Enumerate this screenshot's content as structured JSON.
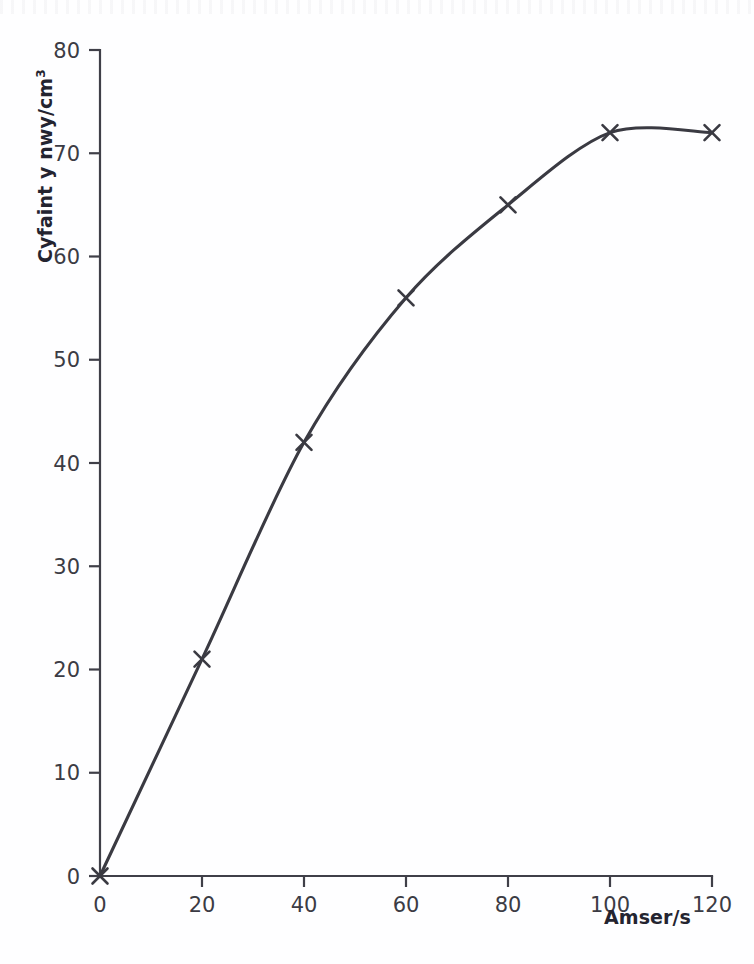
{
  "figure": {
    "background_color": "#fefeff",
    "ink_color": "#3a3a42",
    "text_color": "#2b2b33"
  },
  "axes": {
    "y_title_main": "Cyfaint y nwy/cm",
    "y_title_superscript": "3",
    "x_title": "Amser/s"
  },
  "chart_data": {
    "type": "line",
    "title": "",
    "xlabel": "Amser/s",
    "ylabel": "Cyfaint y nwy/cm3",
    "xlim": [
      0,
      120
    ],
    "ylim": [
      0,
      80
    ],
    "xticks": [
      0,
      20,
      40,
      60,
      80,
      100,
      120
    ],
    "yticks": [
      0,
      10,
      20,
      30,
      40,
      50,
      60,
      70,
      80
    ],
    "xtick_labels": [
      "0",
      "20",
      "40",
      "60",
      "80",
      "100",
      "120"
    ],
    "ytick_labels": [
      "0",
      "10",
      "20",
      "30",
      "40",
      "50",
      "60",
      "70",
      "80"
    ],
    "grid": false,
    "legend": null,
    "marker": "x",
    "line_color": "#3a3a42",
    "line_width": 3,
    "x": [
      0,
      20,
      40,
      60,
      80,
      100,
      120
    ],
    "values": [
      0,
      21,
      42,
      56,
      65,
      72,
      72
    ],
    "series": [
      {
        "name": "Cyfaint y nwy",
        "x": [
          0,
          20,
          40,
          60,
          80,
          100,
          120
        ],
        "values": [
          0,
          21,
          42,
          56,
          65,
          72,
          72
        ]
      }
    ],
    "points": [
      {
        "x": 0,
        "y": 0
      },
      {
        "x": 20,
        "y": 21
      },
      {
        "x": 40,
        "y": 42
      },
      {
        "x": 60,
        "y": 56
      },
      {
        "x": 80,
        "y": 65
      },
      {
        "x": 100,
        "y": 72
      },
      {
        "x": 120,
        "y": 72
      }
    ],
    "annotations": []
  }
}
